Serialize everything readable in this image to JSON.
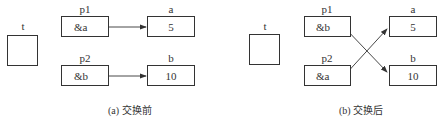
{
  "panels": [
    {
      "id": "before",
      "caption": "(a) 交换前",
      "temp": {
        "name": "t",
        "value": ""
      },
      "pointers": [
        {
          "name": "p1",
          "value": "&a",
          "target": "a"
        },
        {
          "name": "p2",
          "value": "&b",
          "target": "b"
        }
      ],
      "variables": [
        {
          "name": "a",
          "value": "5"
        },
        {
          "name": "b",
          "value": "10"
        }
      ]
    },
    {
      "id": "after",
      "caption": "(b) 交换后",
      "temp": {
        "name": "t",
        "value": ""
      },
      "pointers": [
        {
          "name": "p1",
          "value": "&b",
          "target": "b"
        },
        {
          "name": "p2",
          "value": "&a",
          "target": "a"
        }
      ],
      "variables": [
        {
          "name": "a",
          "value": "5"
        },
        {
          "name": "b",
          "value": "10"
        }
      ]
    }
  ],
  "colors": {
    "stroke": "#333333",
    "background": "#ffffff"
  }
}
